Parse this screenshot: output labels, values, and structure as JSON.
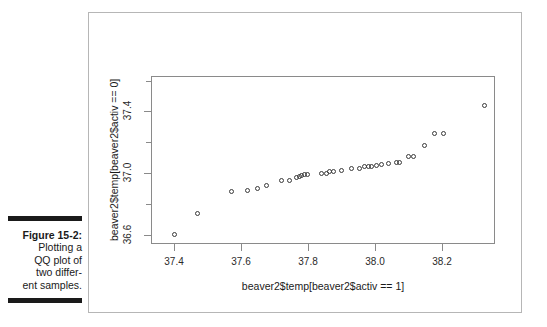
{
  "figure": {
    "caption_label": "Figure 15-2:",
    "caption_body": "Plotting a\nQQ plot of\ntwo differ-\nent samples.",
    "frame_color": "#b6b6b6",
    "axis_color": "#8a8a8a",
    "point_color": "#3a3a3a"
  },
  "chart_data": {
    "type": "scatter",
    "title": "",
    "xlabel": "beaver2$temp[beaver2$activ == 1]",
    "ylabel": "beaver2$temp[beaver2$activ == 0]",
    "xlim": [
      37.33,
      38.36
    ],
    "ylim": [
      36.54,
      37.63
    ],
    "grid": false,
    "legend": null,
    "xticks": [
      {
        "value": 37.4,
        "label": "37.4",
        "major": true
      },
      {
        "value": 37.6,
        "label": "37.6",
        "major": true
      },
      {
        "value": 37.8,
        "label": "37.8",
        "major": true
      },
      {
        "value": 38.0,
        "label": "38.0",
        "major": true
      },
      {
        "value": 38.2,
        "label": "38.2",
        "major": true
      }
    ],
    "yticks": [
      {
        "value": 36.6,
        "label": "36.6",
        "major": true
      },
      {
        "value": 36.8,
        "label": "",
        "major": false
      },
      {
        "value": 37.0,
        "label": "37.0",
        "major": true
      },
      {
        "value": 37.2,
        "label": "",
        "major": false
      },
      {
        "value": 37.4,
        "label": "37.4",
        "major": true
      },
      {
        "value": 37.6,
        "label": "",
        "major": false
      }
    ],
    "points": [
      {
        "x": 37.4,
        "y": 36.6
      },
      {
        "x": 37.47,
        "y": 36.74
      },
      {
        "x": 37.57,
        "y": 36.88
      },
      {
        "x": 37.62,
        "y": 36.89
      },
      {
        "x": 37.65,
        "y": 36.9
      },
      {
        "x": 37.675,
        "y": 36.92
      },
      {
        "x": 37.72,
        "y": 36.95
      },
      {
        "x": 37.745,
        "y": 36.95
      },
      {
        "x": 37.765,
        "y": 36.97
      },
      {
        "x": 37.775,
        "y": 36.98
      },
      {
        "x": 37.78,
        "y": 36.985
      },
      {
        "x": 37.79,
        "y": 36.99
      },
      {
        "x": 37.8,
        "y": 36.99
      },
      {
        "x": 37.84,
        "y": 37.0
      },
      {
        "x": 37.855,
        "y": 37.0
      },
      {
        "x": 37.865,
        "y": 37.01
      },
      {
        "x": 37.875,
        "y": 37.01
      },
      {
        "x": 37.9,
        "y": 37.02
      },
      {
        "x": 37.93,
        "y": 37.03
      },
      {
        "x": 37.955,
        "y": 37.03
      },
      {
        "x": 37.97,
        "y": 37.04
      },
      {
        "x": 37.98,
        "y": 37.04
      },
      {
        "x": 37.99,
        "y": 37.045
      },
      {
        "x": 38.005,
        "y": 37.05
      },
      {
        "x": 38.02,
        "y": 37.055
      },
      {
        "x": 38.04,
        "y": 37.06
      },
      {
        "x": 38.065,
        "y": 37.07
      },
      {
        "x": 38.075,
        "y": 37.07
      },
      {
        "x": 38.1,
        "y": 37.11
      },
      {
        "x": 38.115,
        "y": 37.11
      },
      {
        "x": 38.15,
        "y": 37.18
      },
      {
        "x": 38.18,
        "y": 37.26
      },
      {
        "x": 38.205,
        "y": 37.26
      },
      {
        "x": 38.33,
        "y": 37.44
      }
    ]
  }
}
